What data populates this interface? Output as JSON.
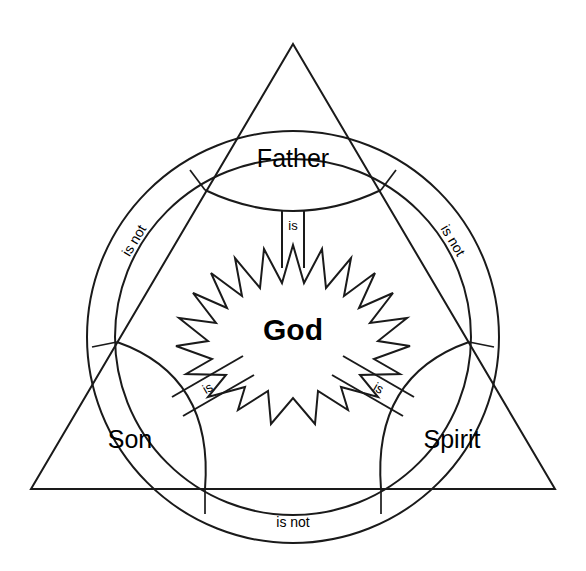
{
  "diagram": {
    "name": "Shield of the Trinity",
    "type": "scutum-fidei",
    "background_color": "#ffffff",
    "stroke_color": "#1a1a1a",
    "nodes": [
      {
        "id": "father",
        "label": "Father",
        "position": "top"
      },
      {
        "id": "son",
        "label": "Son",
        "position": "bottom-left"
      },
      {
        "id": "spirit",
        "label": "Spirit",
        "position": "bottom-right"
      },
      {
        "id": "god",
        "label": "God",
        "position": "center",
        "shape": "starburst"
      }
    ],
    "relations": [
      {
        "id": "father-god",
        "label": "is",
        "from": "father",
        "to": "god",
        "orientation": "vertical"
      },
      {
        "id": "son-god",
        "label": "is",
        "from": "son",
        "to": "god",
        "orientation": "diagonal-up-right"
      },
      {
        "id": "spirit-god",
        "label": "is",
        "from": "spirit",
        "to": "god",
        "orientation": "diagonal-up-left"
      },
      {
        "id": "father-son",
        "label": "is not",
        "from": "father",
        "to": "son",
        "orientation": "arc-left"
      },
      {
        "id": "father-spirit",
        "label": "is not",
        "from": "father",
        "to": "spirit",
        "orientation": "arc-right"
      },
      {
        "id": "son-spirit",
        "label": "is not",
        "from": "son",
        "to": "spirit",
        "orientation": "arc-bottom"
      }
    ],
    "labels": {
      "father": "Father",
      "son": "Son",
      "spirit": "Spirit",
      "god": "God",
      "is": "is",
      "is_not": "is not"
    }
  }
}
